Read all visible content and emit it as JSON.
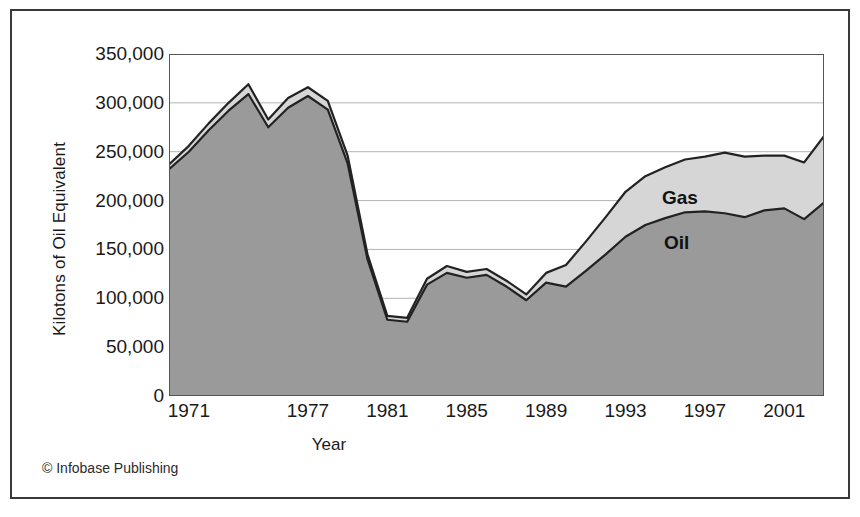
{
  "figure": {
    "credit": "© Infobase Publishing"
  },
  "chart_data": {
    "type": "area",
    "stacked": true,
    "title": "",
    "subtitle": "",
    "xlabel": "Year",
    "ylabel": "Kilotons of Oil Equivalent",
    "xlim": [
      1970,
      2003
    ],
    "ylim": [
      0,
      350000
    ],
    "grid": true,
    "grid_axis": "y",
    "legend_position": "inside-plot",
    "colors": {
      "oil": "#9a9a9a",
      "gas": "#d6d6d6",
      "outline": "#222222",
      "grid": "#b3b3b3",
      "axis": "#555555",
      "text": "#1a1a1a"
    },
    "yticks": [
      "0",
      "50,000",
      "100,000",
      "150,000",
      "200,000",
      "250,000",
      "300,000",
      "350,000"
    ],
    "ytick_values": [
      0,
      50000,
      100000,
      150000,
      200000,
      250000,
      300000,
      350000
    ],
    "xticks": [
      "1971",
      "1977",
      "1981",
      "1985",
      "1989",
      "1993",
      "1997",
      "2001"
    ],
    "xtick_values": [
      1971,
      1977,
      1981,
      1985,
      1989,
      1993,
      1997,
      2001
    ],
    "x": [
      1970,
      1971,
      1972,
      1973,
      1974,
      1975,
      1976,
      1977,
      1978,
      1979,
      1980,
      1981,
      1982,
      1983,
      1984,
      1985,
      1986,
      1987,
      1988,
      1989,
      1990,
      1991,
      1992,
      1993,
      1994,
      1995,
      1996,
      1997,
      1998,
      1999,
      2000,
      2001,
      2002,
      2003
    ],
    "series": [
      {
        "name": "Oil",
        "label": "Oil",
        "color": "#9a9a9a",
        "values": [
          232000,
          250000,
          272000,
          292000,
          309000,
          275000,
          295000,
          307000,
          293000,
          238000,
          140000,
          78000,
          76000,
          114000,
          126000,
          121000,
          124000,
          112000,
          98000,
          116000,
          112000,
          128000,
          145000,
          163000,
          175000,
          182000,
          188000,
          189000,
          187000,
          183000,
          190000,
          192000,
          181000,
          198000
        ]
      },
      {
        "name": "Gas",
        "label": "Gas",
        "color": "#d6d6d6",
        "values": [
          5000,
          6000,
          7000,
          8000,
          10000,
          8000,
          10000,
          9000,
          9000,
          8000,
          5000,
          4000,
          4000,
          6000,
          7000,
          6000,
          6000,
          6000,
          6000,
          10000,
          22000,
          30000,
          38000,
          46000,
          50000,
          52000,
          54000,
          56000,
          62000,
          62000,
          56000,
          54000,
          58000,
          68000
        ]
      }
    ],
    "totals": [
      237000,
      256000,
      279000,
      300000,
      319000,
      283000,
      305000,
      316000,
      302000,
      246000,
      145000,
      82000,
      80000,
      120000,
      133000,
      127000,
      130000,
      118000,
      104000,
      126000,
      134000,
      158000,
      183000,
      209000,
      225000,
      234000,
      242000,
      245000,
      249000,
      245000,
      246000,
      246000,
      239000,
      266000
    ]
  }
}
